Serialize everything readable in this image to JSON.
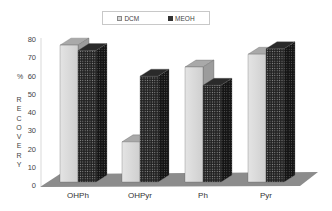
{
  "chart_data": {
    "type": "bar",
    "title": "",
    "xlabel": "",
    "ylabel": "% RECOVERY",
    "ylim": [
      0,
      80
    ],
    "yticks": [
      0,
      10,
      20,
      30,
      40,
      50,
      60,
      70,
      80
    ],
    "categories": [
      "OHPh",
      "OHPyr",
      "Ph",
      "Pyr"
    ],
    "series": [
      {
        "name": "DCM",
        "color": "#d6d6d6",
        "values": [
          75,
          22,
          63,
          70
        ]
      },
      {
        "name": "MEOH",
        "color": "#3a3a3a",
        "values": [
          72,
          58,
          53,
          73
        ]
      }
    ],
    "legend_position": "top",
    "grid": false,
    "style": "3d-clustered"
  },
  "legend": {
    "dcm": "DCM",
    "meoh": "MEOH"
  },
  "axis": {
    "ylabel_letters": [
      "R",
      "E",
      "C",
      "O",
      "V",
      "E",
      "R",
      "Y"
    ],
    "ylabel_prefix": "%",
    "ticks": [
      "80",
      "70",
      "60",
      "50",
      "40",
      "30",
      "20",
      "10",
      "0"
    ]
  }
}
